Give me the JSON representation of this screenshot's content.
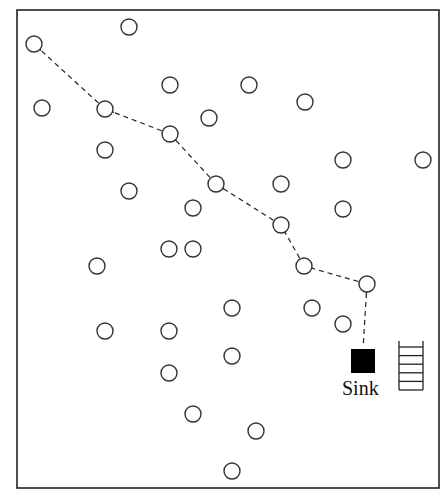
{
  "diagram": {
    "type": "wireless-sensor-network-routing",
    "canvas": {
      "width": 444,
      "height": 496
    },
    "border": {
      "x": 17,
      "y": 10,
      "width": 422,
      "height": 478,
      "color": "#222222"
    },
    "node_radius": 8,
    "node_stroke": "#333333",
    "edge_color": "#222222",
    "sink": {
      "label": "Sink",
      "x": 351,
      "y": 349,
      "size": 24,
      "color": "#000000",
      "label_x": 342,
      "label_y": 378
    },
    "queue": {
      "name": "buffer-queue",
      "x": 399,
      "y": 341,
      "width": 24,
      "height": 49,
      "rungs": 6
    },
    "nodes": [
      {
        "id": "n1",
        "x": 34,
        "y": 44,
        "on_path": true
      },
      {
        "id": "n2",
        "x": 129,
        "y": 27,
        "on_path": false
      },
      {
        "id": "n3",
        "x": 42,
        "y": 108,
        "on_path": false
      },
      {
        "id": "n4",
        "x": 105,
        "y": 109,
        "on_path": true
      },
      {
        "id": "n5",
        "x": 170,
        "y": 85,
        "on_path": false
      },
      {
        "id": "n6",
        "x": 249,
        "y": 85,
        "on_path": false
      },
      {
        "id": "n7",
        "x": 305,
        "y": 102,
        "on_path": false
      },
      {
        "id": "n8",
        "x": 209,
        "y": 118,
        "on_path": false
      },
      {
        "id": "n9",
        "x": 170,
        "y": 134,
        "on_path": true
      },
      {
        "id": "n10",
        "x": 105,
        "y": 150,
        "on_path": false
      },
      {
        "id": "n11",
        "x": 343,
        "y": 160,
        "on_path": false
      },
      {
        "id": "n12",
        "x": 423,
        "y": 160,
        "on_path": false
      },
      {
        "id": "n13",
        "x": 129,
        "y": 191,
        "on_path": false
      },
      {
        "id": "n14",
        "x": 216,
        "y": 184,
        "on_path": true
      },
      {
        "id": "n15",
        "x": 281,
        "y": 184,
        "on_path": false
      },
      {
        "id": "n16",
        "x": 193,
        "y": 208,
        "on_path": false
      },
      {
        "id": "n17",
        "x": 343,
        "y": 209,
        "on_path": false
      },
      {
        "id": "n18",
        "x": 281,
        "y": 225,
        "on_path": true
      },
      {
        "id": "n19",
        "x": 169,
        "y": 249,
        "on_path": false
      },
      {
        "id": "n20",
        "x": 193,
        "y": 249,
        "on_path": false
      },
      {
        "id": "n21",
        "x": 97,
        "y": 266,
        "on_path": false
      },
      {
        "id": "n22",
        "x": 304,
        "y": 266,
        "on_path": true
      },
      {
        "id": "n23",
        "x": 367,
        "y": 284,
        "on_path": true
      },
      {
        "id": "n24",
        "x": 232,
        "y": 308,
        "on_path": false
      },
      {
        "id": "n25",
        "x": 312,
        "y": 308,
        "on_path": false
      },
      {
        "id": "n26",
        "x": 343,
        "y": 324,
        "on_path": false
      },
      {
        "id": "n27",
        "x": 105,
        "y": 331,
        "on_path": false
      },
      {
        "id": "n28",
        "x": 169,
        "y": 331,
        "on_path": false
      },
      {
        "id": "n29",
        "x": 232,
        "y": 356,
        "on_path": false
      },
      {
        "id": "n30",
        "x": 169,
        "y": 373,
        "on_path": false
      },
      {
        "id": "n31",
        "x": 193,
        "y": 414,
        "on_path": false
      },
      {
        "id": "n32",
        "x": 256,
        "y": 431,
        "on_path": false
      },
      {
        "id": "n33",
        "x": 232,
        "y": 471,
        "on_path": false
      }
    ],
    "edges": [
      {
        "from": "sink",
        "to": "n23",
        "style": "dashed",
        "arrow": "open"
      },
      {
        "from": "n23",
        "to": "n22",
        "style": "dashed",
        "arrow": "open"
      },
      {
        "from": "n22",
        "to": "n18",
        "style": "dashed",
        "arrow": "open"
      },
      {
        "from": "n18",
        "to": "n14",
        "style": "dashed",
        "arrow": "open"
      },
      {
        "from": "n14",
        "to": "n9",
        "style": "dashed",
        "arrow": "open"
      },
      {
        "from": "n9",
        "to": "n4",
        "style": "dashed",
        "arrow": "open"
      },
      {
        "from": "n4",
        "to": "n1",
        "style": "dashed",
        "arrow": "open"
      }
    ]
  }
}
